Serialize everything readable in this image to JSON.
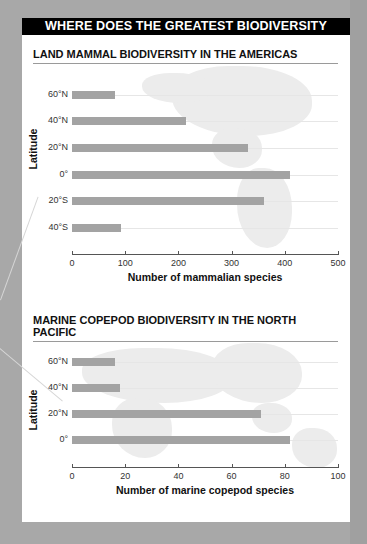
{
  "header": {
    "title": "WHERE DOES THE GREATEST BIODIVERSITY OCCUR?"
  },
  "colors": {
    "bar": "#a3a3a3",
    "header_bg": "#000000",
    "card_bg": "#ffffff",
    "page_bg": "#a8a8a8"
  },
  "chart_data": [
    {
      "type": "bar",
      "orientation": "horizontal",
      "title": "LAND MAMMAL BIODIVERSITY IN THE AMERICAS",
      "ylabel": "Latitude",
      "xlabel": "Number of mammalian species",
      "categories": [
        "60°N",
        "40°N",
        "20°N",
        "0°",
        "20°S",
        "40°S"
      ],
      "values": [
        80,
        215,
        330,
        410,
        360,
        92
      ],
      "xlim": [
        0,
        500
      ],
      "xticks": [
        "0",
        "100",
        "200",
        "300",
        "400",
        "500"
      ],
      "grid": true,
      "background": "map of the Americas"
    },
    {
      "type": "bar",
      "orientation": "horizontal",
      "title": "MARINE COPEPOD BIODIVERSITY IN THE NORTH PACIFIC",
      "ylabel": "Latitude",
      "xlabel": "Number of marine copepod species",
      "categories": [
        "60°N",
        "40°N",
        "20°N",
        "0°"
      ],
      "values": [
        16,
        18,
        71,
        82
      ],
      "xlim": [
        0,
        100
      ],
      "xticks": [
        "0",
        "20",
        "40",
        "60",
        "80",
        "100"
      ],
      "grid": true,
      "background": "map of the North Pacific"
    }
  ]
}
